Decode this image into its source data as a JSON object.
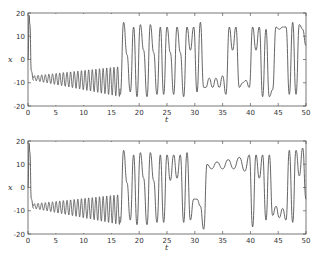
{
  "chart_data": [
    {
      "type": "line",
      "title": "",
      "xlabel": "t",
      "ylabel": "x",
      "xlim": [
        0,
        50
      ],
      "ylim": [
        -20,
        20
      ],
      "xticks": [
        0,
        5,
        10,
        15,
        20,
        25,
        30,
        35,
        40,
        45,
        50
      ],
      "yticks": [
        -20,
        -10,
        0,
        10,
        20
      ],
      "grid": false,
      "series": [
        {
          "name": "x(t) top",
          "description": "Lorenz x-component: initial spike to ~19 at t≈0.3, drops to ~-9 by t≈1, growing oscillation around -8 until t≈16.5 (min ~-15), then chaotic switching between lobes; upper lobe bursts near +8..+15 at t≈17-24, 25-27, 28-31; lower lobe oscillations around -8..-12 for t≈32-36 and 38-42; upper lobe again t≈43-47 and 48-50.",
          "x": [
            0,
            0.2,
            0.35,
            0.6,
            1.0,
            1.5,
            3,
            5,
            7,
            9,
            11,
            13,
            15,
            16,
            16.6,
            17.2,
            17.8,
            18.4,
            19,
            19.6,
            20.2,
            20.8,
            21.4,
            22,
            22.6,
            23.2,
            23.8,
            24.4,
            25,
            25.6,
            26.2,
            26.8,
            27.4,
            28,
            28.6,
            29.2,
            29.8,
            30.4,
            31,
            31.6,
            32,
            32.6,
            33.2,
            33.8,
            34.4,
            35,
            35.6,
            36.2,
            36.8,
            37.4,
            38,
            38.6,
            39.2,
            39.8,
            40.4,
            41,
            41.6,
            42.2,
            42.8,
            43.4,
            44,
            44.6,
            45.2,
            45.8,
            46.4,
            47,
            47.6,
            48.2,
            48.8,
            49.4,
            50
          ],
          "y": [
            0,
            19,
            15,
            -5,
            -9,
            -9,
            -8,
            -9,
            -8,
            -9,
            -8,
            -10,
            -12,
            -13,
            -15,
            16,
            2,
            -14,
            14,
            -16,
            15,
            4,
            -16,
            15,
            3,
            -15,
            14,
            -15,
            14,
            3,
            -15,
            14,
            3,
            -16,
            14,
            4,
            14,
            -14,
            16,
            -12,
            -12,
            -8,
            -12,
            -8,
            -12,
            -7,
            -15,
            14,
            4,
            14,
            -12,
            -10,
            -9,
            -12,
            14,
            4,
            14,
            -16,
            13,
            -16,
            -13,
            14,
            13,
            14,
            14,
            -15,
            16,
            -15,
            15,
            13,
            6
          ]
        }
      ]
    },
    {
      "type": "line",
      "title": "",
      "xlabel": "t",
      "ylabel": "x",
      "xlim": [
        0,
        50
      ],
      "ylim": [
        -20,
        20
      ],
      "xticks": [
        0,
        5,
        10,
        15,
        20,
        25,
        30,
        35,
        40,
        45,
        50
      ],
      "yticks": [
        -20,
        -10,
        0,
        10,
        20
      ],
      "grid": false,
      "series": [
        {
          "name": "x(t) bottom",
          "description": "Perturbed Lorenz trajectory: identical to top until t≈25, then diverges; lower spikes near t≈28.5, 30, 31.5 (~-18); upper-lobe growing oscillation ~+7..+14 for t≈32-40; then chaotic switching t≈40-50.",
          "x": [
            0,
            0.2,
            0.35,
            0.6,
            1.0,
            1.5,
            3,
            5,
            7,
            9,
            11,
            13,
            15,
            16,
            16.6,
            17.2,
            17.8,
            18.4,
            19,
            19.6,
            20.2,
            20.8,
            21.4,
            22,
            22.6,
            23.2,
            23.8,
            24.4,
            25,
            25.6,
            26.2,
            26.8,
            27.4,
            28,
            28.6,
            29.2,
            29.8,
            30.4,
            31,
            31.6,
            32.2,
            33,
            34,
            35,
            36,
            37,
            38,
            39,
            39.8,
            40.4,
            41,
            41.6,
            42.2,
            42.8,
            43.4,
            44,
            44.6,
            45.2,
            45.8,
            46.4,
            47,
            47.6,
            48.2,
            48.8,
            49.4,
            50
          ],
          "y": [
            0,
            19,
            15,
            -5,
            -9,
            -9,
            -8,
            -9,
            -8,
            -9,
            -8,
            -10,
            -12,
            -13,
            -15,
            16,
            2,
            -14,
            14,
            -16,
            15,
            4,
            -16,
            15,
            3,
            -15,
            14,
            -15,
            14,
            3,
            14,
            4,
            14,
            -15,
            15,
            -14,
            -5,
            -5,
            -8,
            -18,
            10,
            8,
            11,
            8,
            12,
            8,
            13,
            7,
            14,
            -17,
            14,
            4,
            14,
            -14,
            14,
            -12,
            -8,
            -13,
            -9,
            -14,
            16,
            -15,
            16,
            5,
            17,
            -5
          ]
        }
      ]
    }
  ],
  "panels": [
    {
      "ylabel": "x",
      "xlabel": "t",
      "yticks": [
        "20",
        "10",
        "0",
        "-10",
        "-20"
      ],
      "xticks": [
        "0",
        "5",
        "10",
        "15",
        "20",
        "25",
        "30",
        "35",
        "40",
        "45",
        "50"
      ]
    },
    {
      "ylabel": "x",
      "xlabel": "t",
      "yticks": [
        "20",
        "10",
        "0",
        "-10",
        "-20"
      ],
      "xticks": [
        "0",
        "5",
        "10",
        "15",
        "20",
        "25",
        "30",
        "35",
        "40",
        "45",
        "50"
      ]
    }
  ],
  "colors": {
    "line": "#555555",
    "axis": "#555555"
  }
}
